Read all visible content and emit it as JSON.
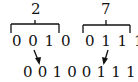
{
  "groups": [
    {
      "decimal": "2",
      "bits": "0 0 1 0"
    },
    {
      "decimal": "7",
      "bits": "0 1 1 1"
    }
  ],
  "combined_bits": "0 0 1 0 0 1 1 1",
  "colors": {
    "ink": "#111111",
    "background": "#ffffff"
  }
}
